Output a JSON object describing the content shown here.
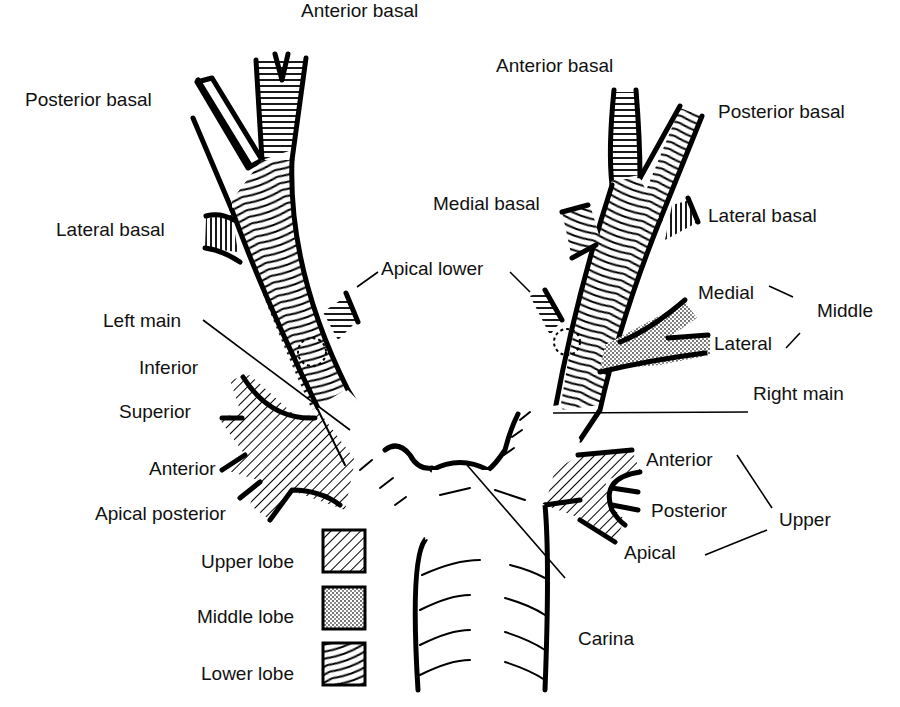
{
  "left_lung": {
    "lower_lobe": [
      "Anterior basal",
      "Posterior basal",
      "Lateral basal",
      "Apical lower"
    ],
    "lingula": [
      "Inferior",
      "Superior"
    ],
    "upper_lobe": [
      "Anterior",
      "Apical posterior"
    ],
    "main_bronchus": "Left main"
  },
  "right_lung": {
    "lower_lobe": [
      "Anterior basal",
      "Posterior basal",
      "Medial basal",
      "Lateral basal",
      "Apical lower"
    ],
    "middle_lobe": {
      "group_label": "Middle",
      "segments": [
        "Medial",
        "Lateral"
      ]
    },
    "upper_lobe": {
      "group_label": "Upper",
      "segments": [
        "Anterior",
        "Posterior",
        "Apical"
      ]
    },
    "main_bronchus": "Right main"
  },
  "carina": "Carina",
  "legend": [
    {
      "label": "Upper lobe",
      "pattern": "diagonal-hatch"
    },
    {
      "label": "Middle lobe",
      "pattern": "stipple"
    },
    {
      "label": "Lower lobe",
      "pattern": "curved-lines"
    }
  ]
}
